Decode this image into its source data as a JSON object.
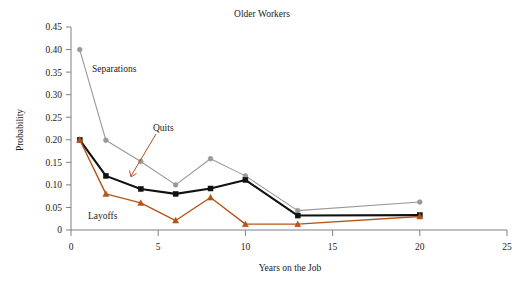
{
  "chart_data": {
    "type": "line",
    "title": "Older Workers",
    "xlabel": "Years on the Job",
    "ylabel": "Probability",
    "xlim": [
      0,
      25
    ],
    "ylim": [
      0,
      0.45
    ],
    "grid": false,
    "legend_position": "inline-annotations",
    "xticks": [
      "0",
      "5",
      "10",
      "15",
      "20",
      "25"
    ],
    "xtick_values": [
      0,
      5,
      10,
      15,
      20,
      25
    ],
    "yticks": [
      "0",
      "0.05",
      "0.10",
      "0.15",
      "0.20",
      "0.25",
      "0.30",
      "0.35",
      "0.40",
      "0.45"
    ],
    "ytick_values": [
      0,
      0.05,
      0.1,
      0.15,
      0.2,
      0.25,
      0.3,
      0.35,
      0.4,
      0.45
    ],
    "series": [
      {
        "name": "Separations",
        "color": "#999999",
        "marker": "circle",
        "x": [
          0.5,
          2,
          4,
          6,
          8,
          10,
          13,
          20
        ],
        "values": [
          0.4,
          0.199,
          0.152,
          0.1,
          0.158,
          0.12,
          0.043,
          0.062
        ]
      },
      {
        "name": "Quits",
        "color": "#111111",
        "marker": "square",
        "x": [
          0.5,
          2,
          4,
          6,
          8,
          10,
          13,
          20
        ],
        "values": [
          0.2,
          0.12,
          0.091,
          0.08,
          0.092,
          0.111,
          0.032,
          0.033
        ]
      },
      {
        "name": "Layoffs",
        "color": "#b5541a",
        "marker": "triangle",
        "x": [
          0.5,
          2,
          4,
          6,
          8,
          10,
          13,
          20
        ],
        "values": [
          0.2,
          0.08,
          0.06,
          0.021,
          0.072,
          0.013,
          0.013,
          0.03
        ]
      }
    ],
    "annotations": [
      {
        "text": "Separations",
        "series": "Separations"
      },
      {
        "text": "Quits",
        "series": "Quits"
      },
      {
        "text": "Layoffs",
        "series": "Layoffs"
      }
    ]
  },
  "colors": {
    "separations": "#999999",
    "quits": "#111111",
    "layoffs": "#b5541a",
    "axis": "#808080",
    "text": "#1a1a1a",
    "background": "#ffffff"
  }
}
